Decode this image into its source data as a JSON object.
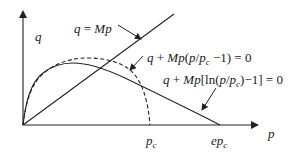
{
  "diagram": {
    "axes": {
      "y_label": "q",
      "x_label": "p"
    },
    "x_ticks": {
      "pc": "p",
      "pc_sub": "c",
      "epc": "ep",
      "epc_sub": "c"
    },
    "curves": [
      {
        "name": "critical-state-line",
        "style": "solid",
        "equation": "q = Mp"
      },
      {
        "name": "modified-cam-clay",
        "style": "dashed",
        "equation": "q + Mp(p/p_c − 1) = 0"
      },
      {
        "name": "original-cam-clay",
        "style": "solid",
        "equation": "q + Mp[ln(p/p_c) − 1] = 0"
      }
    ],
    "labels": {
      "line_eq_a": "q",
      "line_eq_b": " = ",
      "line_eq_c": "Mp",
      "mcc_eq_a": "q",
      "mcc_eq_b": " + ",
      "mcc_eq_c": "Mp",
      "mcc_eq_d": "(",
      "mcc_eq_e": "p",
      "mcc_eq_f": "/",
      "mcc_eq_g": "p",
      "mcc_eq_h": "c",
      "mcc_eq_i": " −1) = 0",
      "occ_eq_a": "q",
      "occ_eq_b": " + ",
      "occ_eq_c": "Mp",
      "occ_eq_d": "[ln(",
      "occ_eq_e": "p",
      "occ_eq_f": "/",
      "occ_eq_g": "p",
      "occ_eq_h": "c",
      "occ_eq_i": ")−1] = 0"
    },
    "colors": {
      "ink": "#222222",
      "background": "#ffffff"
    }
  }
}
